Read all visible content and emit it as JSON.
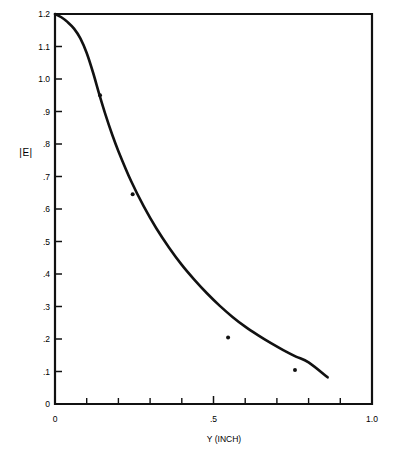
{
  "chart_data": {
    "type": "line",
    "title": "",
    "subtitle": "",
    "xlabel": "Y (INCH)",
    "ylabel": "|E|",
    "xlim": [
      0,
      1.0
    ],
    "ylim": [
      0,
      1.2
    ],
    "grid": false,
    "legend": "none",
    "x_tick_labels": [
      "0",
      ".5",
      "1.0"
    ],
    "x_tick_values": [
      0,
      0.5,
      1.0
    ],
    "x_minor_tick_values": [
      0.1,
      0.2,
      0.3,
      0.4,
      0.6,
      0.7,
      0.8,
      0.9
    ],
    "y_tick_labels": [
      "0",
      ".1",
      ".2",
      ".3",
      ".4",
      ".5",
      ".6",
      ".7",
      ".8",
      ".9",
      "1.0",
      "1.1",
      "1.2"
    ],
    "y_tick_values": [
      0,
      0.1,
      0.2,
      0.3,
      0.4,
      0.5,
      0.6,
      0.7,
      0.8,
      0.9,
      1.0,
      1.1,
      1.2
    ],
    "series": [
      {
        "name": "theoretical curve",
        "style": "line",
        "color": "#111111",
        "x": [
          0.0,
          0.02,
          0.04,
          0.06,
          0.08,
          0.1,
          0.12,
          0.14,
          0.16,
          0.18,
          0.2,
          0.24,
          0.28,
          0.32,
          0.36,
          0.4,
          0.44,
          0.48,
          0.52,
          0.56,
          0.6,
          0.64,
          0.68,
          0.72,
          0.76,
          0.8,
          0.86
        ],
        "y": [
          1.2,
          1.19,
          1.175,
          1.155,
          1.125,
          1.08,
          1.02,
          0.952,
          0.888,
          0.83,
          0.778,
          0.686,
          0.608,
          0.54,
          0.481,
          0.428,
          0.382,
          0.34,
          0.302,
          0.268,
          0.238,
          0.212,
          0.188,
          0.166,
          0.146,
          0.128,
          0.082
        ]
      },
      {
        "name": "measured points",
        "style": "scatter",
        "color": "#111111",
        "x": [
          0.142,
          0.245,
          0.546,
          0.757
        ],
        "y": [
          0.95,
          0.645,
          0.205,
          0.105
        ]
      }
    ]
  },
  "figure": {
    "axis_y_label": "|E|",
    "axis_x_label": "Y (INCH)"
  }
}
